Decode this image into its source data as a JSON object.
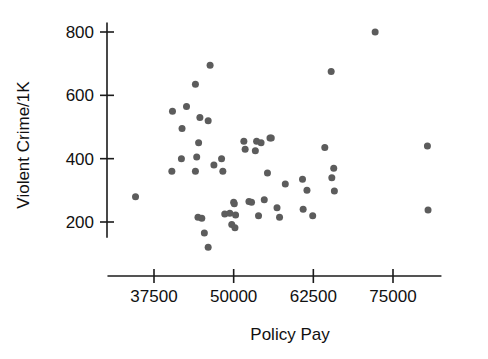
{
  "chart_data": {
    "type": "scatter",
    "title": "",
    "xlabel": "Policy Pay",
    "ylabel": "Violent Crime/1K",
    "xlim": [
      30000,
      83000
    ],
    "ylim": [
      100,
      830
    ],
    "xticks": [
      37500,
      50000,
      62500,
      75000
    ],
    "xtick_labels": [
      "37500",
      "50000",
      "62500",
      "75000"
    ],
    "yticks": [
      200,
      400,
      600,
      800
    ],
    "ytick_labels": [
      "200",
      "400",
      "600",
      "800"
    ],
    "grid": false,
    "legend": null,
    "marker": "circle",
    "marker_color": "#5c5c5c",
    "marker_size": 7,
    "n_points": 54,
    "points": [
      {
        "x": 34600,
        "y": 280
      },
      {
        "x": 40400,
        "y": 550
      },
      {
        "x": 42600,
        "y": 565
      },
      {
        "x": 44700,
        "y": 530
      },
      {
        "x": 41900,
        "y": 495
      },
      {
        "x": 46000,
        "y": 520
      },
      {
        "x": 46300,
        "y": 695
      },
      {
        "x": 44000,
        "y": 635
      },
      {
        "x": 44500,
        "y": 450
      },
      {
        "x": 44200,
        "y": 405
      },
      {
        "x": 41800,
        "y": 400
      },
      {
        "x": 40300,
        "y": 360
      },
      {
        "x": 44000,
        "y": 360
      },
      {
        "x": 46900,
        "y": 380
      },
      {
        "x": 48100,
        "y": 400
      },
      {
        "x": 48300,
        "y": 360
      },
      {
        "x": 44400,
        "y": 215
      },
      {
        "x": 45000,
        "y": 212
      },
      {
        "x": 45400,
        "y": 165
      },
      {
        "x": 46000,
        "y": 120
      },
      {
        "x": 48600,
        "y": 225
      },
      {
        "x": 49400,
        "y": 228
      },
      {
        "x": 50000,
        "y": 262
      },
      {
        "x": 50100,
        "y": 258
      },
      {
        "x": 50300,
        "y": 222
      },
      {
        "x": 49700,
        "y": 192
      },
      {
        "x": 50200,
        "y": 182
      },
      {
        "x": 51600,
        "y": 455
      },
      {
        "x": 51800,
        "y": 430
      },
      {
        "x": 52400,
        "y": 265
      },
      {
        "x": 52800,
        "y": 262
      },
      {
        "x": 53600,
        "y": 455
      },
      {
        "x": 54300,
        "y": 450
      },
      {
        "x": 53400,
        "y": 425
      },
      {
        "x": 55700,
        "y": 465
      },
      {
        "x": 55900,
        "y": 465
      },
      {
        "x": 53900,
        "y": 220
      },
      {
        "x": 55300,
        "y": 355
      },
      {
        "x": 54800,
        "y": 270
      },
      {
        "x": 56800,
        "y": 245
      },
      {
        "x": 58100,
        "y": 320
      },
      {
        "x": 57200,
        "y": 215
      },
      {
        "x": 60900,
        "y": 240
      },
      {
        "x": 61500,
        "y": 300
      },
      {
        "x": 60800,
        "y": 335
      },
      {
        "x": 62400,
        "y": 220
      },
      {
        "x": 64300,
        "y": 435
      },
      {
        "x": 65300,
        "y": 675
      },
      {
        "x": 65400,
        "y": 340
      },
      {
        "x": 65700,
        "y": 370
      },
      {
        "x": 65800,
        "y": 298
      },
      {
        "x": 72200,
        "y": 800
      },
      {
        "x": 80400,
        "y": 440
      },
      {
        "x": 80500,
        "y": 238
      }
    ]
  },
  "axes": {
    "x_axis_name": "x-axis",
    "y_axis_name": "y-axis"
  }
}
